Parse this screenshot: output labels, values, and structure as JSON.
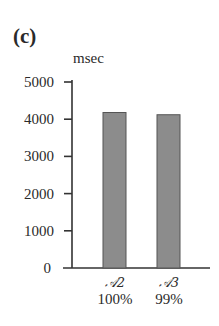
{
  "panel_label": "(c)",
  "chart_data": {
    "type": "bar",
    "title": "",
    "xlabel": "",
    "ylabel": "msec",
    "ylim": [
      0,
      5000
    ],
    "yticks": [
      0,
      1000,
      2000,
      3000,
      4000,
      5000
    ],
    "grid": false,
    "legend": null,
    "categories": [
      "𝒜2 100%",
      "𝒜3 99%"
    ],
    "category_lines": [
      [
        "𝒜2",
        "100%"
      ],
      [
        "𝒜3",
        "99%"
      ]
    ],
    "values": [
      4180,
      4120
    ],
    "bar_color": "#8c8c8c",
    "bar_edge_color": "#555555"
  },
  "yaxis": {
    "unit": "msec",
    "ticks": [
      "0",
      "1000",
      "2000",
      "3000",
      "4000",
      "5000"
    ]
  },
  "xaxis": {
    "labels": [
      {
        "symbol": "𝒜2",
        "pct": "100%"
      },
      {
        "symbol": "𝒜3",
        "pct": "99%"
      }
    ]
  }
}
